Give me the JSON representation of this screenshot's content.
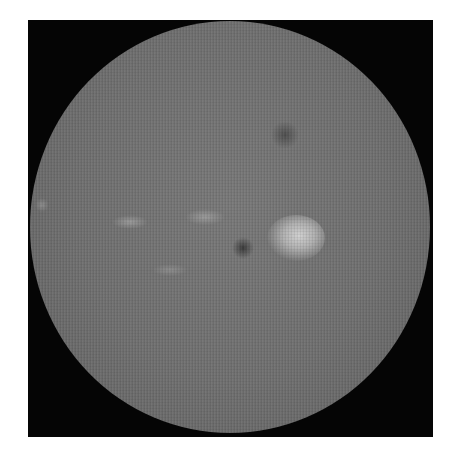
{
  "image": {
    "subject": "grayscale retinal fundus photograph",
    "frame_color": "#050505",
    "background_color": "#ffffff",
    "fundus_base_color": "#717171",
    "features": [
      {
        "name": "optic-disc-bright-spot",
        "cx": 296,
        "cy": 238,
        "w": 58,
        "h": 46,
        "color": "#c4c4c4"
      },
      {
        "name": "dark-spot-center",
        "cx": 243,
        "cy": 248,
        "w": 22,
        "h": 22,
        "color": "#3c3c3c"
      },
      {
        "name": "dark-spot-upper",
        "cx": 285,
        "cy": 135,
        "w": 30,
        "h": 26,
        "color": "#555555"
      },
      {
        "name": "pale-streak-left",
        "cx": 130,
        "cy": 222,
        "w": 36,
        "h": 14,
        "color": "#959595"
      },
      {
        "name": "pale-streak-mid",
        "cx": 205,
        "cy": 217,
        "w": 40,
        "h": 16,
        "color": "#959595"
      },
      {
        "name": "pale-streak-lower",
        "cx": 170,
        "cy": 270,
        "w": 36,
        "h": 12,
        "color": "#8a8a8a"
      },
      {
        "name": "pale-spot-edge",
        "cx": 42,
        "cy": 205,
        "w": 14,
        "h": 14,
        "color": "#8a8a8a"
      }
    ]
  }
}
